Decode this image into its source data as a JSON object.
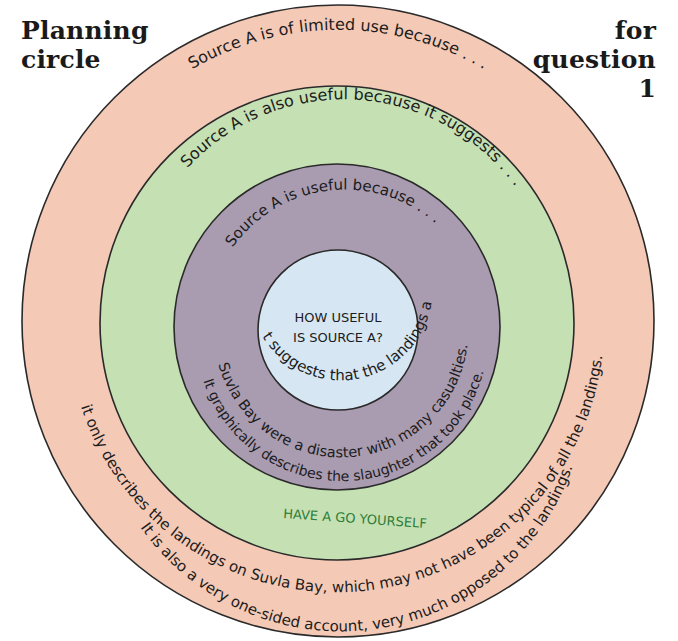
{
  "title": {
    "left_line1": "Planning",
    "left_line2": "circle",
    "right_line1": "for",
    "right_line2": "question",
    "right_line3": "1"
  },
  "colors": {
    "outer_ring": "#f4c9b6",
    "green_ring": "#c5e0b3",
    "purple_ring": "#a99bb0",
    "center_circle": "#d6e6f2",
    "outline": "#2a2a2a",
    "prompt_green": "#2f7d3a"
  },
  "rings": {
    "outer": {
      "prompt": "Source A is of limited use because . . .",
      "answer_line1": "it only describes the landings on Suvla Bay, which may not have been typical of all the landings.",
      "answer_line2": "It is also a very one-sided account, very much opposed to the landings."
    },
    "green": {
      "prompt": "Source A is also useful because it suggests . . .",
      "hint": "HAVE A GO YOURSELF"
    },
    "purple": {
      "prompt": "Source A is useful because . . .",
      "answer_line1": "it suggests that the landings at",
      "answer_line2": "Suvla Bay were a disaster with many casualties.",
      "answer_line3": "It graphically describes the slaughter that took place."
    },
    "center": {
      "line1": "HOW USEFUL",
      "line2": "IS SOURCE A?"
    }
  }
}
